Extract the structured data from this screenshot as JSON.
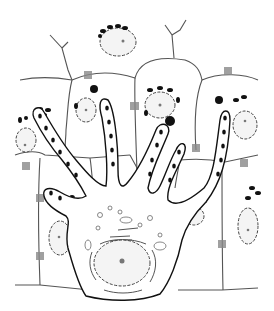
{
  "figure": {
    "type": "scientific line illustration",
    "labels": [],
    "colors": {
      "background": "#ffffff",
      "line": "#222222",
      "granules": "#111111",
      "stipple": "#ececec"
    },
    "counts": {
      "tubular_extensions": 7,
      "visible_host_nuclei": 7
    }
  }
}
